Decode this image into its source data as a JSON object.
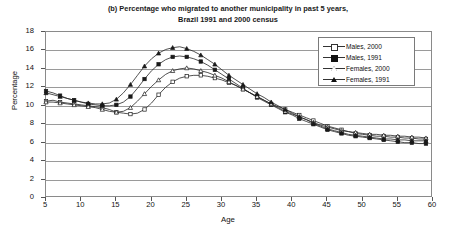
{
  "chart_data": {
    "type": "line",
    "title": "(b) Percentage who migrated to another municipality in past 5 years, Brazil 1991 and 2000 census",
    "title_line1": "(b) Percentage who migrated to another municipality in past 5 years,",
    "title_line2": "Brazil 1991 and 2000 census",
    "xlabel": "Age",
    "ylabel": "Percentage",
    "xlim": [
      5,
      60
    ],
    "ylim": [
      0,
      18
    ],
    "xticks": [
      5,
      10,
      15,
      20,
      25,
      30,
      35,
      40,
      45,
      50,
      55,
      60
    ],
    "yticks": [
      0,
      2,
      4,
      6,
      8,
      10,
      12,
      14,
      16,
      18
    ],
    "grid": "horizontal",
    "legend_position": "top-right",
    "x": [
      5,
      6,
      7,
      8,
      9,
      10,
      11,
      12,
      13,
      14,
      15,
      16,
      17,
      18,
      19,
      20,
      21,
      22,
      23,
      24,
      25,
      26,
      27,
      28,
      29,
      30,
      31,
      32,
      33,
      34,
      35,
      36,
      37,
      38,
      39,
      40,
      41,
      42,
      43,
      44,
      45,
      46,
      47,
      48,
      49,
      50,
      51,
      52,
      53,
      54,
      55,
      56,
      57,
      58,
      59
    ],
    "series": [
      {
        "name": "Males, 2000",
        "marker": "open-square",
        "values": [
          10.5,
          10.6,
          10.4,
          10.3,
          10.2,
          10.1,
          10.0,
          9.9,
          9.8,
          9.6,
          9.3,
          9.2,
          9.1,
          9.2,
          9.6,
          10.3,
          11.2,
          12.0,
          12.6,
          13.0,
          13.2,
          13.3,
          13.3,
          13.2,
          13.0,
          12.8,
          12.5,
          12.2,
          11.8,
          11.4,
          11.0,
          10.6,
          10.2,
          9.9,
          9.6,
          9.3,
          9.0,
          8.7,
          8.4,
          8.1,
          7.8,
          7.6,
          7.4,
          7.2,
          7.0,
          6.9,
          6.8,
          6.7,
          6.7,
          6.6,
          6.6,
          6.5,
          6.5,
          6.4,
          6.4
        ]
      },
      {
        "name": "Males, 1991",
        "marker": "filled-square",
        "values": [
          11.6,
          11.4,
          11.1,
          10.8,
          10.6,
          10.4,
          10.2,
          10.1,
          10.0,
          10.0,
          10.1,
          10.4,
          11.0,
          11.9,
          12.9,
          13.8,
          14.5,
          15.0,
          15.3,
          15.4,
          15.3,
          15.1,
          14.8,
          14.4,
          13.9,
          13.4,
          12.9,
          12.4,
          11.9,
          11.4,
          10.9,
          10.5,
          10.1,
          9.7,
          9.3,
          9.0,
          8.6,
          8.3,
          8.0,
          7.7,
          7.4,
          7.2,
          7.0,
          6.8,
          6.7,
          6.6,
          6.5,
          6.4,
          6.3,
          6.2,
          6.1,
          6.0,
          6.0,
          5.9,
          5.9
        ]
      },
      {
        "name": "Females, 2000",
        "marker": "open-triangle",
        "values": [
          10.4,
          10.4,
          10.3,
          10.2,
          10.1,
          10.0,
          9.9,
          9.8,
          9.6,
          9.4,
          9.3,
          9.4,
          9.8,
          10.5,
          11.3,
          12.1,
          12.8,
          13.4,
          13.8,
          14.0,
          14.1,
          14.0,
          13.8,
          13.6,
          13.3,
          13.0,
          12.6,
          12.2,
          11.8,
          11.4,
          11.0,
          10.6,
          10.2,
          9.8,
          9.4,
          9.1,
          8.8,
          8.5,
          8.2,
          7.9,
          7.7,
          7.5,
          7.3,
          7.2,
          7.1,
          7.0,
          6.9,
          6.9,
          6.8,
          6.8,
          6.7,
          6.7,
          6.6,
          6.6,
          6.5
        ]
      },
      {
        "name": "Females, 1991",
        "marker": "filled-triangle",
        "values": [
          11.4,
          11.2,
          11.0,
          10.8,
          10.6,
          10.4,
          10.3,
          10.2,
          10.2,
          10.3,
          10.7,
          11.4,
          12.3,
          13.3,
          14.3,
          15.1,
          15.7,
          16.1,
          16.3,
          16.4,
          16.2,
          15.9,
          15.5,
          15.0,
          14.5,
          13.9,
          13.3,
          12.8,
          12.3,
          11.8,
          11.3,
          10.9,
          10.4,
          10.0,
          9.6,
          9.2,
          8.8,
          8.5,
          8.1,
          7.8,
          7.5,
          7.3,
          7.1,
          6.9,
          6.8,
          6.7,
          6.6,
          6.5,
          6.4,
          6.4,
          6.3,
          6.3,
          6.2,
          6.2,
          6.2
        ]
      }
    ]
  },
  "legend": {
    "items": [
      {
        "label": "Males, 2000"
      },
      {
        "label": "Males, 1991"
      },
      {
        "label": "Females, 2000"
      },
      {
        "label": "Females, 1991"
      }
    ]
  }
}
